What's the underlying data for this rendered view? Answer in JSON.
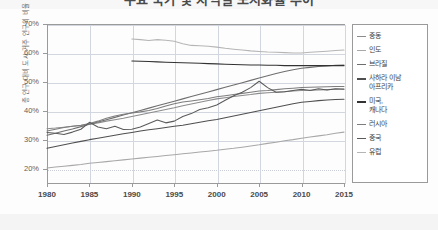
{
  "chart_title": "주요 국가 및 지역별 도시화율 추이",
  "legend_title": "",
  "axis": {
    "y_title": "총 인구 대비 도시 거주 인구의 비율",
    "y_ticks": [
      "70%",
      "60%",
      "50%",
      "40%",
      "30%",
      "20%"
    ],
    "x_ticks": [
      "1980",
      "1985",
      "1990",
      "1995",
      "2000",
      "2005",
      "2010",
      "2015"
    ]
  },
  "colors": {
    "middle_east": "#8c8c8c",
    "india": "#a8a8a8",
    "brazil": "#6e6e6e",
    "subsaharan_africa": "#4f4f4f",
    "usa_canada": "#333333",
    "russia": "#7d7d7d",
    "china": "#5a5a5a",
    "europe": "#b5b5b5"
  },
  "legend": {
    "items": [
      {
        "label": "중동",
        "color": "#8c8c8c"
      },
      {
        "label": "인도",
        "color": "#a8a8a8"
      },
      {
        "label": "브라질",
        "color": "#6e6e6e"
      },
      {
        "label": "사하라 이남\n아프리카",
        "color": "#4f4f4f"
      },
      {
        "label": "미국,\n캐나다",
        "color": "#333333"
      },
      {
        "label": "러시아",
        "color": "#7d7d7d"
      },
      {
        "label": "중국",
        "color": "#5a5a5a"
      },
      {
        "label": "유럽",
        "color": "#b5b5b5"
      }
    ]
  },
  "chart_data": {
    "type": "line",
    "title": "주요 국가 및 지역별 도시화율 추이",
    "xlabel": "",
    "ylabel": "총 인구 대비 도시 거주 인구의 비율",
    "xlim": [
      1980,
      2015
    ],
    "ylim": [
      15,
      70
    ],
    "ytick_values": [
      70,
      60,
      50,
      40,
      30,
      20
    ],
    "xtick_values": [
      1980,
      1985,
      1990,
      1995,
      2000,
      2005,
      2010,
      2015
    ],
    "grid": true,
    "legend_position": "right",
    "y_unit": "%",
    "series": [
      {
        "name": "중동",
        "color": "#8c8c8c",
        "x": [
          1980,
          1981,
          1982,
          1983,
          1984,
          1985,
          1986,
          1987,
          1988,
          1989,
          1990,
          1991,
          1992,
          1993,
          1994,
          1995,
          1996,
          1997,
          1998,
          1999,
          2000,
          2001,
          2002,
          2003,
          2004,
          2005,
          2006,
          2007,
          2008,
          2009,
          2010,
          2011,
          2012,
          2013,
          2014,
          2015
        ],
        "values": [
          33.8,
          34.0,
          34.3,
          34.6,
          34.9,
          35.3,
          35.8,
          36.4,
          36.9,
          37.4,
          38.0,
          38.6,
          39.2,
          39.8,
          40.4,
          41.0,
          41.7,
          42.3,
          42.9,
          43.5,
          44.1,
          44.5,
          44.9,
          45.3,
          45.6,
          46.0,
          46.2,
          46.4,
          46.6,
          46.8,
          47.0,
          47.1,
          47.2,
          47.3,
          47.4,
          47.5
        ]
      },
      {
        "name": "인도",
        "color": "#a8a8a8",
        "x": [
          1980,
          1981,
          1982,
          1983,
          1984,
          1985,
          1986,
          1987,
          1988,
          1989,
          1990,
          1991,
          1992,
          1993,
          1994,
          1995,
          1996,
          1997,
          1998,
          1999,
          2000,
          2001,
          2002,
          2003,
          2004,
          2005,
          2006,
          2007,
          2008,
          2009,
          2010,
          2011,
          2012,
          2013,
          2014,
          2015
        ],
        "values": [
          20.2,
          20.5,
          20.8,
          21.1,
          21.4,
          21.8,
          22.1,
          22.4,
          22.7,
          23.0,
          23.3,
          23.6,
          23.9,
          24.2,
          24.5,
          24.8,
          25.1,
          25.4,
          25.7,
          26.0,
          26.3,
          26.7,
          27.0,
          27.4,
          27.8,
          28.2,
          28.7,
          29.1,
          29.6,
          30.0,
          30.5,
          30.9,
          31.3,
          31.7,
          32.2,
          32.6
        ]
      },
      {
        "name": "브라질",
        "color": "#6e6e6e",
        "x": [
          1980,
          1981,
          1982,
          1983,
          1984,
          1985,
          1986,
          1987,
          1988,
          1989,
          1990,
          1991,
          1992,
          1993,
          1994,
          1995,
          1996,
          1997,
          1998,
          1999,
          2000,
          2001,
          2002,
          2003,
          2004,
          2005,
          2006,
          2007,
          2008,
          2009,
          2010,
          2011,
          2012,
          2013,
          2014,
          2015
        ],
        "values": [
          31.5,
          32.2,
          33.0,
          33.7,
          34.5,
          35.3,
          36.1,
          36.9,
          37.7,
          38.5,
          39.3,
          40.1,
          40.9,
          41.7,
          42.5,
          43.3,
          44.1,
          44.9,
          45.7,
          46.5,
          47.3,
          48.1,
          48.9,
          49.7,
          50.5,
          51.3,
          52.1,
          52.9,
          53.6,
          54.2,
          54.7,
          55.0,
          55.3,
          55.5,
          55.7,
          55.8
        ]
      },
      {
        "name": "사하라 이남 아프리카",
        "color": "#4f4f4f",
        "x": [
          1980,
          1981,
          1982,
          1983,
          1984,
          1985,
          1986,
          1987,
          1988,
          1989,
          1990,
          1991,
          1992,
          1993,
          1994,
          1995,
          1996,
          1997,
          1998,
          1999,
          2000,
          2001,
          2002,
          2003,
          2004,
          2005,
          2006,
          2007,
          2008,
          2009,
          2010,
          2011,
          2012,
          2013,
          2014,
          2015
        ],
        "values": [
          27.0,
          27.6,
          28.2,
          28.8,
          29.4,
          30.0,
          30.5,
          31.0,
          31.5,
          32.0,
          32.5,
          33.0,
          33.4,
          33.8,
          34.2,
          34.6,
          35.0,
          35.5,
          36.0,
          36.5,
          37.0,
          37.6,
          38.2,
          38.8,
          39.4,
          40.0,
          40.6,
          41.2,
          41.8,
          42.4,
          42.9,
          43.2,
          43.5,
          43.7,
          43.9,
          44.0
        ]
      },
      {
        "name": "미국, 캐나다",
        "color": "#333333",
        "x": [
          1990,
          1991,
          1992,
          1993,
          1994,
          1995,
          1996,
          1997,
          1998,
          1999,
          2000,
          2001,
          2002,
          2003,
          2004,
          2005,
          2006,
          2007,
          2008,
          2009,
          2010,
          2011,
          2012,
          2013,
          2014,
          2015
        ],
        "values": [
          57.2,
          57.1,
          57.0,
          56.9,
          56.8,
          56.7,
          56.6,
          56.5,
          56.4,
          56.3,
          56.2,
          56.1,
          56.0,
          55.9,
          55.8,
          55.8,
          55.7,
          55.7,
          55.6,
          55.6,
          55.6,
          55.6,
          55.6,
          55.6,
          55.6,
          55.6
        ]
      },
      {
        "name": "러시아",
        "color": "#7d7d7d",
        "x": [
          1980,
          1981,
          1982,
          1983,
          1984,
          1985,
          1986,
          1987,
          1988,
          1989,
          1990,
          1991,
          1992,
          1993,
          1994,
          1995,
          1996,
          1997,
          1998,
          1999,
          2000,
          2001,
          2002,
          2003,
          2004,
          2005,
          2006,
          2007,
          2008,
          2009,
          2010,
          2011,
          2012,
          2013,
          2014,
          2015
        ],
        "values": [
          33.0,
          33.6,
          34.2,
          34.6,
          35.0,
          35.6,
          36.4,
          37.4,
          38.2,
          38.8,
          39.2,
          39.6,
          40.1,
          40.8,
          41.6,
          42.4,
          43.0,
          43.4,
          43.8,
          44.2,
          44.8,
          45.2,
          45.6,
          46.0,
          46.4,
          46.8,
          47.0,
          47.3,
          47.6,
          47.8,
          48.0,
          48.1,
          48.2,
          48.3,
          48.4,
          48.4
        ]
      },
      {
        "name": "중국",
        "color": "#5a5a5a",
        "x": [
          1980,
          1981,
          1982,
          1983,
          1984,
          1985,
          1986,
          1987,
          1988,
          1989,
          1990,
          1991,
          1992,
          1993,
          1994,
          1995,
          1996,
          1997,
          1998,
          1999,
          2000,
          2001,
          2002,
          2003,
          2004,
          2005,
          2006,
          2007,
          2008,
          2009,
          2010,
          2011,
          2012,
          2013,
          2014,
          2015
        ],
        "values": [
          32.5,
          32.2,
          31.8,
          32.6,
          33.6,
          36.0,
          34.4,
          33.8,
          34.6,
          33.5,
          33.6,
          34.4,
          35.6,
          36.8,
          35.8,
          36.4,
          38.0,
          39.0,
          40.4,
          41.0,
          42.0,
          43.6,
          45.2,
          46.4,
          48.0,
          50.2,
          48.0,
          46.4,
          46.6,
          47.0,
          47.4,
          47.0,
          47.6,
          47.2,
          47.6,
          47.4
        ]
      },
      {
        "name": "유럽",
        "color": "#b5b5b5",
        "x": [
          1990,
          1991,
          1992,
          1993,
          1994,
          1995,
          1996,
          1997,
          1998,
          1999,
          2000,
          2001,
          2002,
          2003,
          2004,
          2005,
          2006,
          2007,
          2008,
          2009,
          2010,
          2011,
          2012,
          2013,
          2014,
          2015
        ],
        "values": [
          64.8,
          64.6,
          64.3,
          64.6,
          64.4,
          64.0,
          63.2,
          62.6,
          62.5,
          62.3,
          62.0,
          61.6,
          61.3,
          61.0,
          60.7,
          60.5,
          60.3,
          60.2,
          60.1,
          60.0,
          60.0,
          60.2,
          60.4,
          60.6,
          60.8,
          61.0
        ]
      }
    ]
  }
}
